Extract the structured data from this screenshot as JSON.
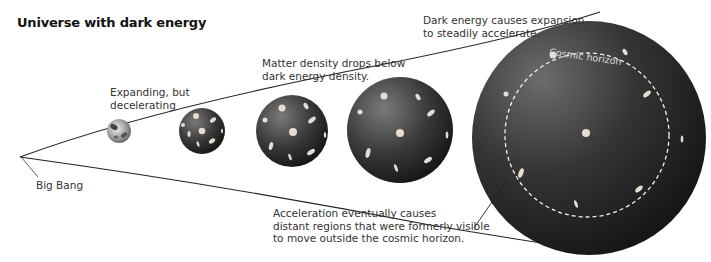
{
  "diagram": {
    "title": "Universe with dark energy",
    "labels": {
      "big_bang": "Big Bang",
      "decelerating_line1": "Expanding, but",
      "decelerating_line2": "decelerating",
      "matter_line1": "Matter density drops below",
      "matter_line2": "dark energy density.",
      "accelerate_line1": "Dark energy causes expansion",
      "accelerate_line2": "to steadily accelerate.",
      "horizon_note_line1": "Acceleration eventually causes",
      "horizon_note_line2": "distant regions that were formerly visible",
      "horizon_note_line3": "to move outside the cosmic horizon.",
      "cosmic_horizon": "Cosmic horizon"
    },
    "stages": [
      {
        "name": "early-universe",
        "cx": 119,
        "cy": 131,
        "r": 12
      },
      {
        "name": "decelerating-universe",
        "cx": 202,
        "cy": 131,
        "r": 23
      },
      {
        "name": "transition-universe",
        "cx": 292,
        "cy": 131,
        "r": 36
      },
      {
        "name": "accelerating-universe",
        "cx": 400,
        "cy": 130,
        "r": 53
      },
      {
        "name": "late-universe",
        "cx": 589,
        "cy": 138,
        "r": 117
      }
    ],
    "colors": {
      "sphere_dark": "#1c1c1c",
      "sphere_light": "#6a6a6a",
      "galaxy": "#e8dcd0",
      "line": "#222222"
    }
  }
}
